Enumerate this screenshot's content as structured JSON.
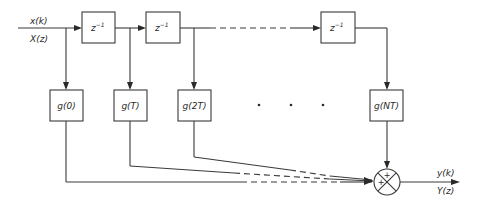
{
  "diagram": {
    "type": "FIR transversal filter block diagram",
    "input": {
      "time_label": "x(k)",
      "z_label": "X(z)"
    },
    "output": {
      "time_label": "y(k)",
      "z_label": "Y(z)"
    },
    "delays": [
      {
        "label": "z",
        "exp": "−1"
      },
      {
        "label": "z",
        "exp": "−1"
      },
      {
        "label": "z",
        "exp": "−1"
      }
    ],
    "gains": [
      {
        "label": "g(0)"
      },
      {
        "label": "g(T)"
      },
      {
        "label": "g(2T)"
      },
      {
        "label": "g(NT)"
      }
    ],
    "ellipsis": "· · ·",
    "summer": {
      "signs": [
        "+",
        "+"
      ]
    },
    "colors": {
      "line": "#3a3a3a",
      "text": "#2a2a2a",
      "background": "#ffffff"
    }
  }
}
